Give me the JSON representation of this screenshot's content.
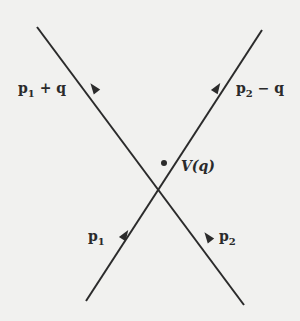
{
  "diagram": {
    "type": "feynman-vertex",
    "vertex_label": "V(q)",
    "lines": [
      {
        "id": "in1",
        "label_main": "p",
        "label_sub": "1",
        "label_rest": "",
        "direction": "incoming"
      },
      {
        "id": "in2",
        "label_main": "p",
        "label_sub": "2",
        "label_rest": "",
        "direction": "incoming"
      },
      {
        "id": "out1",
        "label_main": "p",
        "label_sub": "1",
        "label_rest": " + q",
        "direction": "outgoing"
      },
      {
        "id": "out2",
        "label_main": "p",
        "label_sub": "2",
        "label_rest": " − q",
        "direction": "outgoing"
      }
    ],
    "colors": {
      "line": "#2b2b2b",
      "background": "#f1f1ef"
    }
  }
}
